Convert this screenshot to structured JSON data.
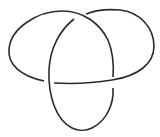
{
  "diagram": {
    "type": "knot",
    "name": "trefoil",
    "stroke_color": "#2b2b2b",
    "background": "#ffffff",
    "crossings": 3
  }
}
